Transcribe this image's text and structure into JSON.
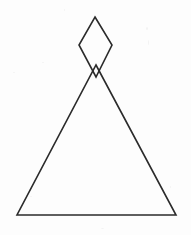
{
  "figure": {
    "background_color": "#fdfdfd",
    "stroke_color": "#2b2b2b",
    "stroke_width": 1.6,
    "canvas": {
      "width": 191,
      "height": 235
    },
    "shapes": [
      {
        "name": "triangle",
        "kind": "polygon",
        "closed": true,
        "points": [
          {
            "x": 96,
            "y": 65
          },
          {
            "x": 176,
            "y": 215
          },
          {
            "x": 17,
            "y": 215
          }
        ],
        "fill": "none"
      },
      {
        "name": "rhombus",
        "kind": "polygon",
        "closed": true,
        "points": [
          {
            "x": 95,
            "y": 17
          },
          {
            "x": 112,
            "y": 45
          },
          {
            "x": 96,
            "y": 77
          },
          {
            "x": 79,
            "y": 45
          }
        ],
        "fill": "none"
      }
    ],
    "intersection": {
      "name": "apex-crossing",
      "x": 96,
      "y": 74
    }
  }
}
